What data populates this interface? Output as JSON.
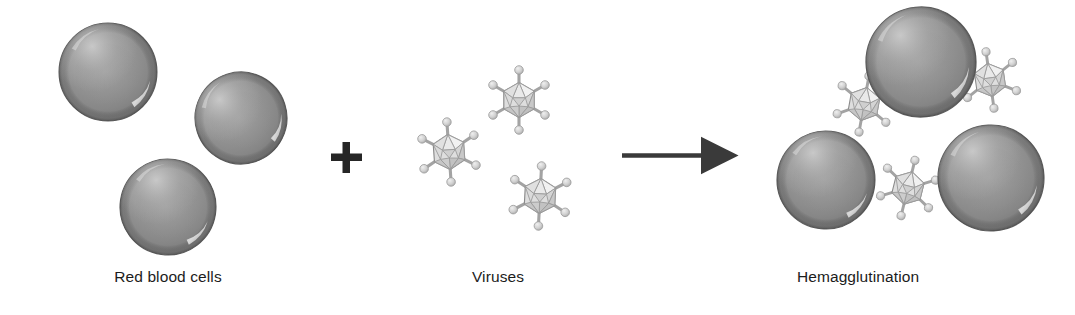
{
  "figure": {
    "background_color": "#ffffff"
  },
  "captions": {
    "left": "Red blood cells",
    "middle": "Viruses",
    "right": "Hemagglutination"
  },
  "operators": {
    "plus": "+",
    "plus_color": "#262626",
    "arrow_label": "reaction-arrow",
    "arrow_color": "#3a3a3a"
  },
  "colors": {
    "rbc_rim": "#6f6f6f",
    "rbc_mid": "#8d8d8d",
    "rbc_center": "#9a9a9a",
    "rbc_highlight": "#d5d5d5",
    "rbc_outline": "#5f5f5f",
    "virus_face_light": "#ededed",
    "virus_face_mid": "#d9d9d9",
    "virus_face_dark": "#c2c2c2",
    "virus_edge": "#8f8f8f",
    "spike_stem": "#a8a8a8",
    "spike_knob": "#d0d0d0",
    "text": "#1c1c1c"
  },
  "groups": {
    "red_blood_cells": {
      "name": "red-blood-cells-group",
      "count": 3,
      "cells": [
        {
          "id": "rbc-left-1",
          "cx": 108,
          "cy": 72,
          "r": 49
        },
        {
          "id": "rbc-left-2",
          "cx": 241,
          "cy": 118,
          "r": 46
        },
        {
          "id": "rbc-left-3",
          "cx": 168,
          "cy": 207,
          "r": 48
        }
      ]
    },
    "viruses": {
      "name": "viruses-group",
      "count": 3,
      "particles": [
        {
          "id": "virus-free-1",
          "cx": 519,
          "cy": 100,
          "r": 30,
          "rot": 0
        },
        {
          "id": "virus-free-2",
          "cx": 449,
          "cy": 152,
          "r": 30,
          "rot": 0
        },
        {
          "id": "virus-free-3",
          "cx": 540,
          "cy": 196,
          "r": 30,
          "rot": 0
        }
      ]
    },
    "hemagglutination": {
      "name": "hemagglutination-group",
      "cells": [
        {
          "id": "rbc-agg-top",
          "cx": 921,
          "cy": 62,
          "r": 55
        },
        {
          "id": "rbc-agg-bottom-left",
          "cx": 826,
          "cy": 180,
          "r": 49
        },
        {
          "id": "rbc-agg-bottom-right",
          "cx": 991,
          "cy": 178,
          "r": 53
        }
      ],
      "bridging_viruses": [
        {
          "id": "virus-bridge-upper-left",
          "cx": 864,
          "cy": 104,
          "r": 28,
          "rot": 0
        },
        {
          "id": "virus-bridge-upper-right",
          "cx": 990,
          "cy": 80,
          "r": 28,
          "rot": 0
        },
        {
          "id": "virus-bridge-bottom",
          "cx": 908,
          "cy": 188,
          "r": 28,
          "rot": 0
        }
      ]
    }
  }
}
